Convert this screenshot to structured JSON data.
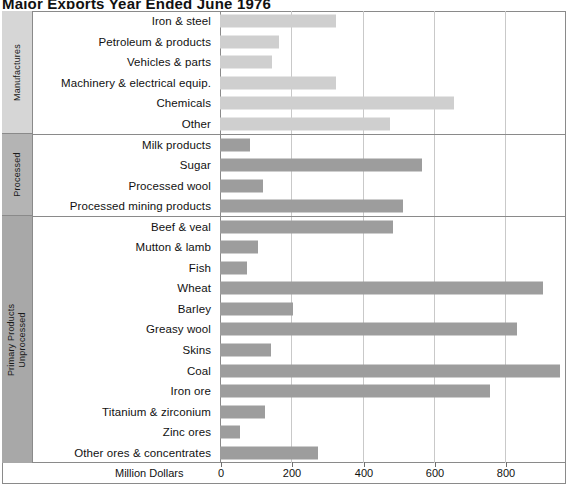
{
  "chart_data": {
    "type": "bar",
    "orientation": "horizontal",
    "title": "Major Exports Year Ended June 1976",
    "xlabel": "Million Dollars",
    "ylabel": "",
    "xlim": [
      0,
      1000
    ],
    "xticks": [
      0,
      200,
      400,
      600,
      800
    ],
    "xtick_labels": [
      "0",
      "200",
      "400",
      "600",
      "800"
    ],
    "grid": true,
    "legend": "none",
    "units": "Million Dollars",
    "groups": [
      {
        "name": "Manufactures",
        "subname": "",
        "bar_color": "#cfcfcf",
        "band_color": "#d6d6d6",
        "categories": [
          "Iron & steel",
          "Petroleum & products",
          "Vehicles & parts",
          "Machinery & electrical equip.",
          "Chemicals",
          "Other"
        ],
        "values": [
          325,
          165,
          147,
          325,
          658,
          478
        ]
      },
      {
        "name": "Processed",
        "subname": "",
        "bar_color": "#9d9d9d",
        "band_color": "#b4b4b4",
        "categories": [
          "Milk products",
          "Sugar",
          "Processed wool",
          "Processed mining products"
        ],
        "values": [
          85,
          568,
          122,
          515
        ]
      },
      {
        "name": "Primary Products",
        "subname": "Unprocessed",
        "bar_color": "#9d9d9d",
        "band_color": "#a8a8a8",
        "categories": [
          "Beef & veal",
          "Mutton & lamb",
          "Fish",
          "Wheat",
          "Barley",
          "Greasy wool",
          "Skins",
          "Coal",
          "Iron ore",
          "Titanium & zirconium",
          "Zinc ores",
          "Other ores & concentrates"
        ],
        "values": [
          487,
          108,
          76,
          908,
          205,
          835,
          143,
          955,
          758,
          126,
          57,
          275
        ]
      }
    ]
  }
}
